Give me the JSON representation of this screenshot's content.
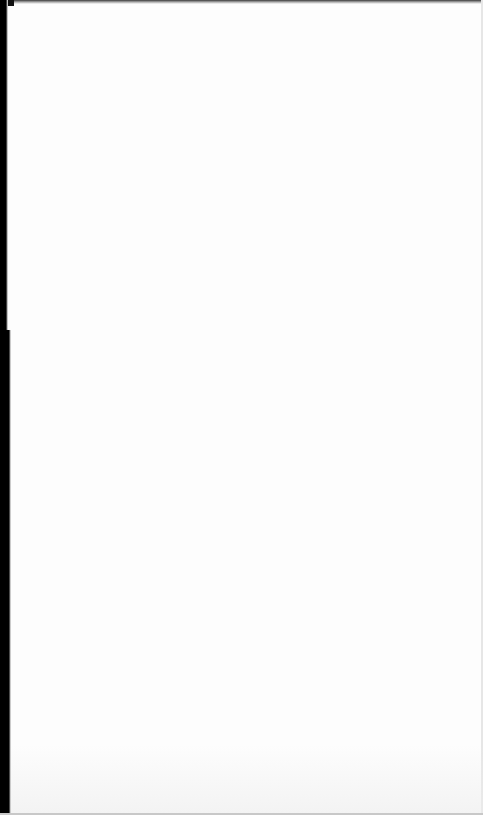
{
  "page": {
    "type": "scanned-blank-verso",
    "background_color": "#fdfdfd",
    "scan_edge_color": "#000000",
    "bleed_through": {
      "visible": true,
      "legible": false,
      "lines": [
        "",
        "",
        "",
        ""
      ]
    }
  }
}
